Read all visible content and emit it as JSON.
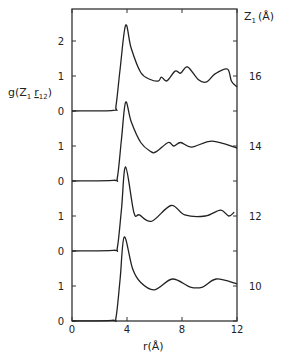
{
  "chart_data": {
    "type": "line",
    "title": "",
    "ylabel": "g(Z1 r12)",
    "xlabel": "r (Å)",
    "right_label": "Z1 (Å)",
    "xlim": [
      0,
      12
    ],
    "x_ticks": [
      0,
      4,
      8,
      12
    ],
    "y_tick_labels_left": [
      "0",
      "1",
      "0",
      "1",
      "0",
      "1",
      "0",
      "1",
      "2"
    ],
    "offset_per_curve": 2,
    "grid": false,
    "legend_position": "right (curve labels)",
    "series": [
      {
        "name": "16",
        "offset": 6,
        "x": [
          0,
          3.0,
          3.2,
          3.5,
          3.9,
          4.3,
          5.0,
          5.7,
          6.3,
          6.5,
          6.9,
          7.5,
          7.9,
          8.4,
          9.2,
          9.8,
          10.4,
          11.3,
          11.6,
          12.0
        ],
        "y": [
          0,
          0.02,
          0.15,
          1.2,
          2.45,
          1.8,
          1.1,
          0.9,
          0.86,
          0.97,
          0.86,
          1.14,
          1.08,
          1.26,
          0.89,
          0.83,
          1.06,
          1.2,
          0.85,
          0.69
        ]
      },
      {
        "name": "14",
        "offset": 4,
        "x": [
          0,
          3.0,
          3.3,
          3.6,
          3.9,
          4.3,
          5.0,
          5.7,
          6.1,
          7.0,
          7.4,
          7.9,
          8.7,
          10.2,
          12.0
        ],
        "y": [
          0,
          0.02,
          0.1,
          1.2,
          2.25,
          1.7,
          1.1,
          0.85,
          0.83,
          1.1,
          1.0,
          1.1,
          0.97,
          1.14,
          0.94
        ]
      },
      {
        "name": "12",
        "offset": 2,
        "x": [
          0,
          3.0,
          3.3,
          3.6,
          3.9,
          4.5,
          4.9,
          5.8,
          7.2,
          8.2,
          9.7,
          10.8,
          11.4,
          11.8
        ],
        "y": [
          0,
          0.02,
          0.1,
          1.2,
          2.4,
          1.1,
          1.03,
          0.85,
          1.3,
          1.03,
          1.0,
          1.17,
          1.0,
          1.11
        ]
      },
      {
        "name": "10",
        "offset": 0,
        "x": [
          0,
          2.9,
          3.2,
          3.5,
          3.8,
          4.4,
          5.0,
          6.0,
          7.3,
          8.6,
          9.5,
          10.5,
          12.0
        ],
        "y": [
          0,
          0.02,
          0.1,
          1.2,
          2.4,
          1.5,
          1.1,
          0.89,
          1.2,
          0.97,
          0.97,
          1.2,
          1.06
        ]
      }
    ]
  },
  "labels": {
    "ylabel": "g(Z",
    "ylabel_sub1": "1",
    "ylabel_r": "r",
    "ylabel_sub2": "12",
    "ylabel_close": ")",
    "xlabel": "r(Å)",
    "right_label": "Z",
    "right_label_sub": "1",
    "right_label_unit": "(Å)"
  }
}
